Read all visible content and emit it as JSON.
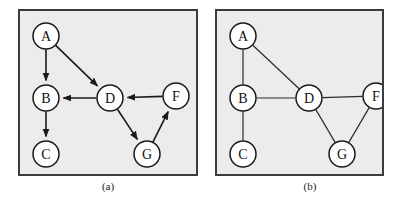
{
  "figure": {
    "background_color": "#ffffff",
    "panel_background_color": "#ececec",
    "panel_border_color": "#3b3b3b",
    "node_fill_color": "#ffffff",
    "node_stroke_color": "#1a1a1a",
    "edge_color": "#1a1a1a"
  },
  "panels": [
    {
      "id": "a",
      "caption": "(a)",
      "graph_type": "directed",
      "nodes": [
        {
          "id": "A",
          "label": "A",
          "cx": 26,
          "cy": 25,
          "r": 13
        },
        {
          "id": "B",
          "label": "B",
          "cx": 26,
          "cy": 87,
          "r": 13
        },
        {
          "id": "C",
          "label": "C",
          "cx": 26,
          "cy": 143,
          "r": 13
        },
        {
          "id": "D",
          "label": "D",
          "cx": 90,
          "cy": 87,
          "r": 13
        },
        {
          "id": "F",
          "label": "F",
          "cx": 156,
          "cy": 85,
          "r": 13
        },
        {
          "id": "G",
          "label": "G",
          "cx": 127,
          "cy": 143,
          "r": 13
        }
      ],
      "edges": [
        {
          "from": "A",
          "to": "B",
          "directed": true
        },
        {
          "from": "A",
          "to": "D",
          "directed": true
        },
        {
          "from": "D",
          "to": "B",
          "directed": true
        },
        {
          "from": "B",
          "to": "C",
          "directed": true
        },
        {
          "from": "D",
          "to": "G",
          "directed": true
        },
        {
          "from": "F",
          "to": "D",
          "directed": true
        },
        {
          "from": "G",
          "to": "F",
          "directed": true
        }
      ]
    },
    {
      "id": "b",
      "caption": "(b)",
      "graph_type": "undirected",
      "nodes": [
        {
          "id": "A",
          "label": "A",
          "cx": 26,
          "cy": 25,
          "r": 13
        },
        {
          "id": "B",
          "label": "B",
          "cx": 26,
          "cy": 87,
          "r": 13
        },
        {
          "id": "C",
          "label": "C",
          "cx": 26,
          "cy": 143,
          "r": 13
        },
        {
          "id": "D",
          "label": "D",
          "cx": 92,
          "cy": 87,
          "r": 13
        },
        {
          "id": "F",
          "label": "F",
          "cx": 159,
          "cy": 85,
          "r": 13
        },
        {
          "id": "G",
          "label": "G",
          "cx": 125,
          "cy": 143,
          "r": 13
        }
      ],
      "edges": [
        {
          "from": "A",
          "to": "B",
          "directed": false
        },
        {
          "from": "A",
          "to": "D",
          "directed": false
        },
        {
          "from": "B",
          "to": "D",
          "directed": false
        },
        {
          "from": "B",
          "to": "C",
          "directed": false
        },
        {
          "from": "D",
          "to": "G",
          "directed": false
        },
        {
          "from": "D",
          "to": "F",
          "directed": false
        },
        {
          "from": "F",
          "to": "G",
          "directed": false
        }
      ]
    }
  ]
}
